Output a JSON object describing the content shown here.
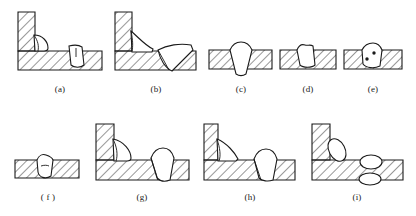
{
  "figure": {
    "title": "",
    "panel_count": 9,
    "background_color": "#ffffff",
    "line_color": "#1a1a1a",
    "hatch_color": "#1a1a1a",
    "weld_fill_color": "#ffffff"
  },
  "panels": [
    {
      "key": "a",
      "label": "(a)",
      "joint_type": "fillet-and-butt-weld-section",
      "description": "T-joint with vertical plate at left; small rounded fillet bead in corner and a triangular root bead in the horizontal plate"
    },
    {
      "key": "b",
      "label": "(b)",
      "joint_type": "fillet-and-butt-weld-section",
      "description": "T-joint with vertical plate at left; large angular fillet bead in corner and a large wedge bead breaking through the horizontal plate"
    },
    {
      "key": "c",
      "label": "(c)",
      "joint_type": "butt-weld-full-penetration",
      "description": "Flat plate with wide V weld fully penetrating and protruding at the root"
    },
    {
      "key": "d",
      "label": "(d)",
      "joint_type": "butt-weld-incomplete-penetration",
      "description": "Flat plate with narrow weld bead not reaching the root face"
    },
    {
      "key": "e",
      "label": "(e)",
      "joint_type": "butt-weld-with-porosity",
      "description": "Flat plate weld bead containing two small round pores"
    },
    {
      "key": "f",
      "label": "( f )",
      "joint_type": "butt-weld-small-bead",
      "description": "Thin flat plate with a small bead and an internal linear defect"
    },
    {
      "key": "g",
      "label": "(g)",
      "joint_type": "fillet-and-butt-weld-section",
      "description": "T-joint with vertical plate at left; rounded fillet bead in corner and a separate bead penetrating the horizontal plate"
    },
    {
      "key": "h",
      "label": "(h)",
      "joint_type": "fillet-and-butt-weld-section",
      "description": "T-joint with thin vertical plate at left; tilted fillet bead in corner and a penetrating bead in the horizontal plate"
    },
    {
      "key": "i",
      "label": "(i)",
      "joint_type": "fillet-and-double-bead-section",
      "description": "T-joint with thin vertical plate at left; oval fillet bead in corner and two stacked oval beads in the horizontal plate"
    }
  ]
}
